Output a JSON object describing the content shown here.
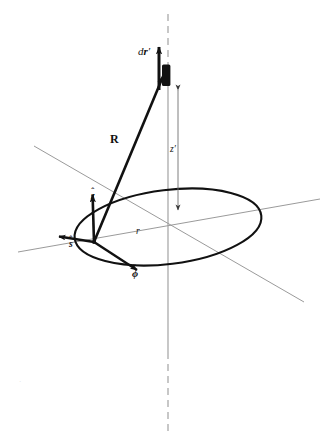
{
  "figure": {
    "background_color": "#ffffff",
    "ink_color": "#111111",
    "axis_color": "#9a9a9a",
    "width": 333,
    "height": 444
  },
  "labels": {
    "source_element": {
      "text": "dr′",
      "d": "d",
      "r": "r",
      "prime": "′",
      "x": 139,
      "y": 48
    },
    "separation_vector": {
      "text": "R",
      "x": 112,
      "y": 135
    },
    "height": {
      "text": "z′",
      "symbol": "z",
      "prime": "′",
      "x": 170,
      "y": 146
    },
    "radius": {
      "text": "r",
      "x": 136,
      "y": 229
    },
    "unit_z": {
      "symbol": "z",
      "accent": "ˆ",
      "text": "ẑ",
      "x": 92,
      "y": 193
    },
    "unit_s": {
      "symbol": "s",
      "accent": "ˆ",
      "text": "ŝ",
      "x": 70,
      "y": 241
    },
    "unit_phi": {
      "symbol": "ϕ",
      "accent": "ˆ",
      "text": "ϕ̂",
      "x": 133,
      "y": 271
    }
  },
  "geometry": {
    "loop": {
      "name": "current-loop-ellipse",
      "center_x": 168,
      "center_y": 227,
      "radius_x": 94,
      "radius_y": 37,
      "rotation_deg": -7
    },
    "vertical_axis": {
      "name": "z-axis",
      "x": 168,
      "top_y": 14,
      "bottom_y": 432,
      "solid_from_y": 86,
      "solid_to_y": 352
    },
    "horizontal_axis_1": {
      "name": "x-axis",
      "x1": 18,
      "y1": 252,
      "x2": 320,
      "y2": 199
    },
    "horizontal_axis_2": {
      "name": "y-axis",
      "x1": 34,
      "y1": 146,
      "x2": 304,
      "y2": 302
    },
    "source_point": {
      "name": "source-element-rect",
      "x": 162,
      "y": 65,
      "width": 8,
      "height": 21
    },
    "vector_R": {
      "name": "vector-R",
      "tail_x": 94,
      "tail_y": 242,
      "tip_x": 164,
      "tip_y": 74
    },
    "arrow_drp": {
      "name": "vector-dr-prime",
      "x": 159,
      "tail_y": 89,
      "tip_y": 44
    },
    "dimension_zp": {
      "name": "dimension-z-prime",
      "x": 178,
      "top_y": 88,
      "bottom_y": 212
    },
    "unit_vector_z": {
      "name": "unit-vector-z",
      "tail_x": 94,
      "tail_y": 242,
      "tip_x": 92,
      "tip_y": 192
    },
    "unit_vector_s": {
      "name": "unit-vector-s",
      "tail_x": 94,
      "tail_y": 242,
      "tip_x": 56,
      "tip_y": 236
    },
    "unit_vector_phi": {
      "name": "unit-vector-phi",
      "tail_x": 94,
      "tail_y": 242,
      "tip_x": 140,
      "tip_y": 272
    }
  },
  "artifacts": {
    "speck": "·"
  }
}
